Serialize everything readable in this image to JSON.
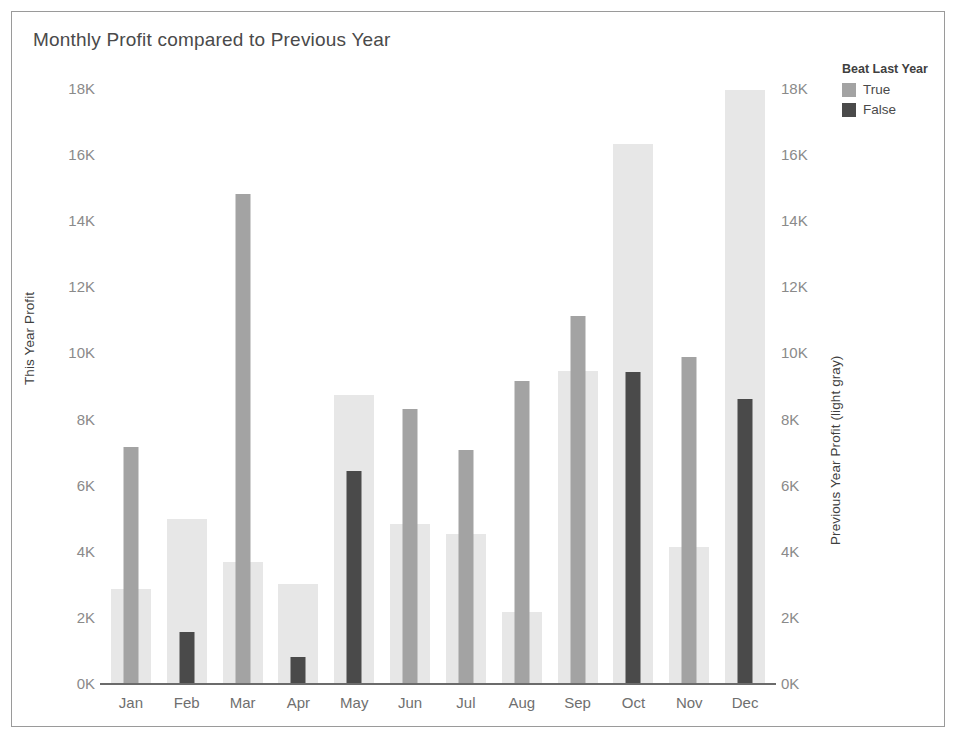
{
  "chart_data": {
    "type": "bar",
    "title": "Monthly Profit compared to Previous Year",
    "xlabel": "",
    "ylabel": "This Year Profit",
    "y2label": "Previous Year Profit (light gray)",
    "categories": [
      "Jan",
      "Feb",
      "Mar",
      "Apr",
      "May",
      "Jun",
      "Jul",
      "Aug",
      "Sep",
      "Oct",
      "Nov",
      "Dec"
    ],
    "ylim": [
      0,
      18000
    ],
    "y2lim": [
      0,
      18000
    ],
    "ytick_labels": [
      "0K",
      "2K",
      "4K",
      "6K",
      "8K",
      "10K",
      "12K",
      "14K",
      "16K",
      "18K"
    ],
    "ytick_values": [
      0,
      2000,
      4000,
      6000,
      8000,
      10000,
      12000,
      14000,
      16000,
      18000
    ],
    "grid": false,
    "legend_position": "right",
    "series": [
      {
        "name": "Previous Year Profit",
        "role": "background",
        "color": "#e7e7e7",
        "values": [
          2850,
          4950,
          3650,
          3000,
          8700,
          4800,
          4500,
          2150,
          9450,
          16300,
          4100,
          17950
        ]
      },
      {
        "name": "This Year Profit",
        "role": "foreground",
        "values": [
          7150,
          1550,
          14800,
          800,
          6400,
          8300,
          7050,
          9150,
          11100,
          9400,
          9850,
          8600
        ],
        "beat_last_year": [
          true,
          false,
          true,
          false,
          false,
          true,
          true,
          true,
          true,
          false,
          true,
          false
        ]
      }
    ],
    "colors": {
      "previous_year": "#e7e7e7",
      "beat_true": "#a3a3a3",
      "beat_false": "#4a4a4a",
      "axis": "#6b6b6b",
      "text": "#4a4a4a",
      "tick_text": "#8a8a8a",
      "frame": "#9a9a9a"
    }
  },
  "legend": {
    "title": "Beat Last Year",
    "items": [
      {
        "label": "True",
        "color": "#a3a3a3"
      },
      {
        "label": "False",
        "color": "#4a4a4a"
      }
    ]
  }
}
